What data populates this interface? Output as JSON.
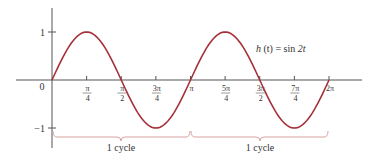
{
  "chart_data": {
    "type": "line",
    "title": "",
    "function_label": "h (t) = sin 2t",
    "function_parts": {
      "name": "h",
      "arg": "(t)",
      "eq": "=",
      "rhs_fn": "sin",
      "rhs_arg": "2t"
    },
    "xlabel": "",
    "ylabel": "",
    "xlim": [
      0,
      6.2832
    ],
    "ylim": [
      -1,
      1
    ],
    "grid": false,
    "legend": null,
    "origin_label": "0",
    "y_ticks": [
      {
        "value": 1,
        "label": "1"
      },
      {
        "value": -1,
        "label": "−1"
      }
    ],
    "x_ticks": [
      {
        "value": 0.7854,
        "num": "π",
        "den": "4"
      },
      {
        "value": 1.5708,
        "num": "π",
        "den": "2"
      },
      {
        "value": 2.3562,
        "num": "3π",
        "den": "4"
      },
      {
        "value": 3.1416,
        "num": "π",
        "den": ""
      },
      {
        "value": 3.927,
        "num": "5π",
        "den": "4"
      },
      {
        "value": 4.7124,
        "num": "3π",
        "den": "2"
      },
      {
        "value": 5.4978,
        "num": "7π",
        "den": "4"
      },
      {
        "value": 6.2832,
        "num": "2π",
        "den": ""
      }
    ],
    "series": [
      {
        "name": "h(t) = sin 2t",
        "color": "#a5303a",
        "x": [
          0,
          0.3927,
          0.7854,
          1.1781,
          1.5708,
          1.9635,
          2.3562,
          2.7489,
          3.1416,
          3.5343,
          3.927,
          4.3197,
          4.7124,
          5.1051,
          5.4978,
          5.8905,
          6.2832
        ],
        "y": [
          0,
          0.7071,
          1,
          0.7071,
          0,
          -0.7071,
          -1,
          -0.7071,
          0,
          0.7071,
          1,
          0.7071,
          0,
          -0.7071,
          -1,
          -0.7071,
          0
        ]
      }
    ],
    "annotations": [
      {
        "type": "bracket",
        "from": 0,
        "to": 3.1416,
        "label": "1 cycle",
        "color": "#d9a3a3"
      },
      {
        "type": "bracket",
        "from": 3.1416,
        "to": 6.2832,
        "label": "1 cycle",
        "color": "#d9a3a3"
      }
    ]
  },
  "labels": {
    "origin": "0",
    "y_pos": "1",
    "y_neg": "−1",
    "func_h": "h",
    "func_t": " (t) = ",
    "func_sin": "sin ",
    "func_arg": "2t",
    "cycle1": "1 cycle",
    "cycle2": "1 cycle",
    "xt": [
      {
        "num": "π",
        "den": "4"
      },
      {
        "num": "π",
        "den": "2"
      },
      {
        "num": "3π",
        "den": "4"
      },
      {
        "num": "π",
        "den": ""
      },
      {
        "num": "5π",
        "den": "4"
      },
      {
        "num": "3π",
        "den": "2"
      },
      {
        "num": "7π",
        "den": "4"
      },
      {
        "num": "2π",
        "den": ""
      }
    ]
  },
  "colors": {
    "curve": "#a5303a",
    "axis": "#555555",
    "bracket": "#d9a3a3",
    "text": "#333333"
  }
}
